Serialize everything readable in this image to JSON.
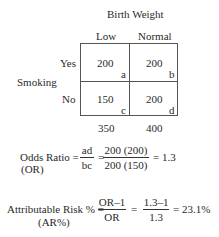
{
  "table": {
    "column_header": "Birth Weight",
    "columns": [
      "Low",
      "Normal"
    ],
    "row_header": "Smoking",
    "rows": [
      "Yes",
      "No"
    ],
    "cells": [
      [
        {
          "value": "200",
          "label": "a"
        },
        {
          "value": "200",
          "label": "b"
        }
      ],
      [
        {
          "value": "150",
          "label": "c"
        },
        {
          "value": "200",
          "label": "d"
        }
      ]
    ],
    "column_totals": [
      "350",
      "400"
    ]
  },
  "odds_ratio": {
    "label": "Odds Ratio =",
    "abbrev": "(OR)",
    "frac1_num": "ad",
    "frac1_den": "bc",
    "eq1": "=",
    "frac2_num": "200 (200)",
    "frac2_den": "200 (150)",
    "result": "= 1.3"
  },
  "attributable_risk": {
    "label": "Attributable Risk % =",
    "abbrev": "(AR%)",
    "frac1_num": "OR–1",
    "frac1_den": "OR",
    "eq1": "=",
    "frac2_num": "1.3–1",
    "frac2_den": "1.3",
    "result": "= 23.1%"
  }
}
